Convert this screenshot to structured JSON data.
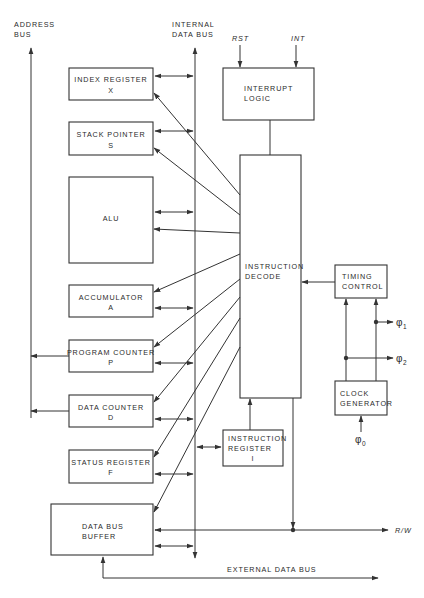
{
  "diagram": {
    "type": "block-diagram",
    "buses": {
      "address_bus": {
        "line1": "ADDRESS",
        "line2": "BUS"
      },
      "internal_data_bus": {
        "line1": "INTERNAL",
        "line2": "DATA BUS"
      },
      "external_data_bus": "EXTERNAL DATA BUS"
    },
    "blocks": {
      "index_register": {
        "name": "INDEX REGISTER",
        "symbol": "X"
      },
      "stack_pointer": {
        "name": "STACK POINTER",
        "symbol": "S"
      },
      "alu": {
        "name": "ALU"
      },
      "accumulator": {
        "name": "ACCUMULATOR",
        "symbol": "A"
      },
      "program_counter": {
        "name": "PROGRAM COUNTER",
        "symbol": "P"
      },
      "data_counter": {
        "name": "DATA COUNTER",
        "symbol": "D"
      },
      "status_register": {
        "name": "STATUS REGISTER",
        "symbol": "F"
      },
      "data_bus_buffer": {
        "line1": "DATA BUS",
        "line2": "BUFFER"
      },
      "interrupt_logic": {
        "line1": "INTERRUPT",
        "line2": "LOGIC"
      },
      "instruction_decode": {
        "line1": "INSTRUCTION",
        "line2": "DECODE"
      },
      "timing_control": {
        "line1": "TIMING",
        "line2": "CONTROL"
      },
      "clock_generator": {
        "line1": "CLOCK",
        "line2": "GENERATOR"
      },
      "instruction_register": {
        "line1": "INSTRUCTION",
        "line2": "REGISTER",
        "symbol": "I"
      }
    },
    "signals": {
      "rst": "RST",
      "int": "INT",
      "rw": "R/W",
      "phi0": {
        "glyph": "φ",
        "sub": "0"
      },
      "phi1": {
        "glyph": "φ",
        "sub": "1"
      },
      "phi2": {
        "glyph": "φ",
        "sub": "2"
      }
    }
  }
}
